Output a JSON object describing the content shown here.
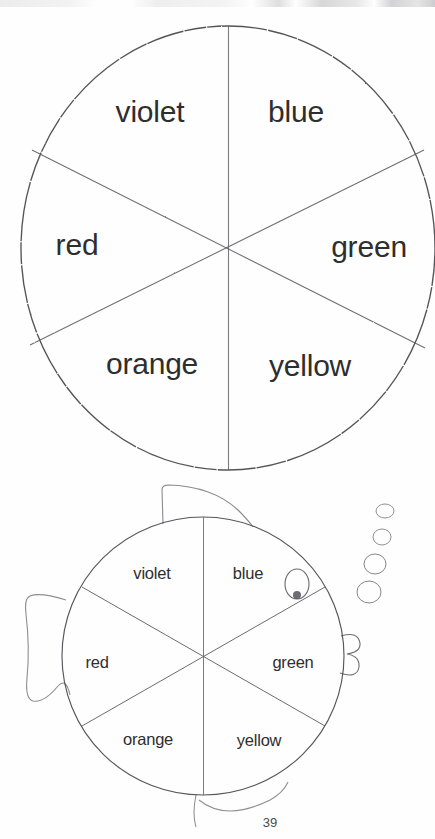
{
  "document": {
    "kind": "worksheet-scan",
    "page_number": "39",
    "ink_color": "#3a3a3a",
    "paper_color": "#fefefe"
  },
  "top_wheel": {
    "name": "color-wheel-large",
    "center": {
      "x": 228,
      "y": 248
    },
    "radius_x": 207,
    "radius_y": 222,
    "sectors": [
      {
        "key": "violet",
        "label": "violet",
        "label_x": 150,
        "label_y": 112,
        "start_deg": 240,
        "end_deg": 300
      },
      {
        "key": "blue",
        "label": "blue",
        "label_x": 296,
        "label_y": 112,
        "start_deg": 300,
        "end_deg": 360
      },
      {
        "key": "green",
        "label": "green",
        "label_x": 369,
        "label_y": 247,
        "start_deg": 0,
        "end_deg": 60
      },
      {
        "key": "yellow",
        "label": "yellow",
        "label_x": 310,
        "label_y": 366,
        "start_deg": 60,
        "end_deg": 120
      },
      {
        "key": "orange",
        "label": "orange",
        "label_x": 152,
        "label_y": 364,
        "start_deg": 120,
        "end_deg": 180
      },
      {
        "key": "red",
        "label": "red",
        "label_x": 77,
        "label_y": 245,
        "start_deg": 180,
        "end_deg": 240
      }
    ]
  },
  "fish_wheel": {
    "name": "color-wheel-fish",
    "center": {
      "x": 203,
      "y": 656
    },
    "radius_x": 141,
    "radius_y": 139,
    "sectors": [
      {
        "key": "violet",
        "label": "violet",
        "label_x": 152,
        "label_y": 573
      },
      {
        "key": "blue",
        "label": "blue",
        "label_x": 248,
        "label_y": 573
      },
      {
        "key": "green",
        "label": "green",
        "label_x": 293,
        "label_y": 662
      },
      {
        "key": "yellow",
        "label": "yellow",
        "label_x": 259,
        "label_y": 740
      },
      {
        "key": "orange",
        "label": "orange",
        "label_x": 148,
        "label_y": 739
      },
      {
        "key": "red",
        "label": "red",
        "label_x": 97,
        "label_y": 662
      }
    ],
    "parts": {
      "dorsal_fin": "dorsal-fin",
      "tail_fin": "tail-fin",
      "bottom_fin": "bottom-fin",
      "eye": "eye",
      "lips": "lips",
      "bubbles_count": 4
    }
  },
  "bubbles": [
    {
      "cx": 385,
      "cy": 511,
      "rx": 9,
      "ry": 7
    },
    {
      "cx": 382,
      "cy": 537,
      "rx": 9,
      "ry": 8
    },
    {
      "cx": 375,
      "cy": 564,
      "rx": 11,
      "ry": 10
    },
    {
      "cx": 369,
      "cy": 592,
      "rx": 12,
      "ry": 11
    }
  ]
}
